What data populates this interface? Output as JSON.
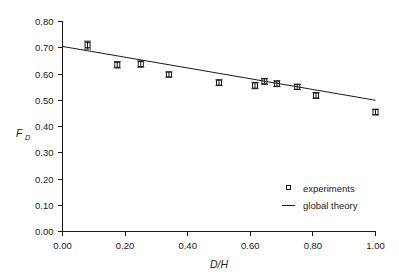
{
  "chart_data": {
    "type": "scatter",
    "title": "",
    "xlabel": "D/H",
    "ylabel": "F_D",
    "ylabel_base": "F",
    "ylabel_sub": "D",
    "xlim": [
      0.0,
      1.0
    ],
    "ylim": [
      0.0,
      0.8
    ],
    "xticks": [
      "0.00",
      "0.20",
      "0.40",
      "0.60",
      "0.80",
      "1.00"
    ],
    "xtick_values": [
      0.0,
      0.2,
      0.4,
      0.6,
      0.8,
      1.0
    ],
    "yticks": [
      "0.00",
      "0.10",
      "0.20",
      "0.30",
      "0.40",
      "0.50",
      "0.60",
      "0.70",
      "0.80"
    ],
    "ytick_values": [
      0.0,
      0.1,
      0.2,
      0.3,
      0.4,
      0.5,
      0.6,
      0.7,
      0.8
    ],
    "grid": false,
    "legend_position": "lower-right",
    "series": [
      {
        "name": "experiments",
        "type": "scatter",
        "marker": "open-square",
        "x": [
          0.08,
          0.175,
          0.25,
          0.34,
          0.5,
          0.615,
          0.645,
          0.685,
          0.75,
          0.81,
          1.0
        ],
        "y": [
          0.71,
          0.635,
          0.638,
          0.598,
          0.567,
          0.556,
          0.572,
          0.563,
          0.551,
          0.518,
          0.455
        ],
        "yerr": [
          0.015,
          0.012,
          0.012,
          0.01,
          0.011,
          0.012,
          0.011,
          0.011,
          0.01,
          0.011,
          0.011
        ]
      },
      {
        "name": "global theory",
        "type": "line",
        "x": [
          0.0,
          1.0
        ],
        "y": [
          0.705,
          0.5
        ]
      }
    ],
    "legend": [
      {
        "label": "experiments",
        "marker": "open-square"
      },
      {
        "label": "global theory",
        "marker": "line"
      }
    ]
  }
}
